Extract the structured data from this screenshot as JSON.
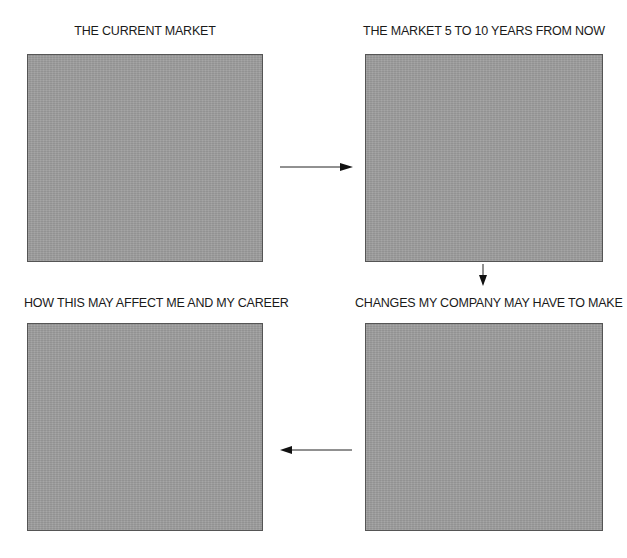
{
  "diagram": {
    "type": "flow",
    "panels": [
      {
        "id": "current",
        "title": "THE CURRENT MARKET"
      },
      {
        "id": "future",
        "title": "THE MARKET 5 TO 10 YEARS FROM NOW"
      },
      {
        "id": "changes",
        "title": "CHANGES MY COMPANY MAY HAVE TO MAKE"
      },
      {
        "id": "career",
        "title": "HOW THIS MAY AFFECT ME AND MY CAREER"
      }
    ],
    "arrows": [
      {
        "from": "current",
        "to": "future",
        "direction": "right"
      },
      {
        "from": "future",
        "to": "changes",
        "direction": "down"
      },
      {
        "from": "changes",
        "to": "career",
        "direction": "left"
      }
    ],
    "colors": {
      "panel_fill": "#9d9d9d",
      "panel_border": "#555555",
      "arrow": "#111111"
    }
  }
}
